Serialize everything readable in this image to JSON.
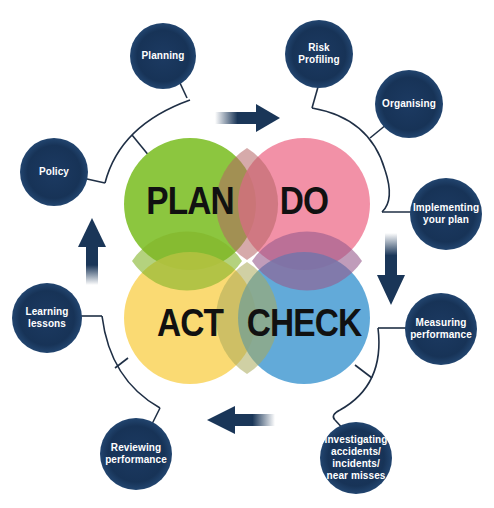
{
  "diagram": {
    "core": [
      {
        "id": "plan",
        "label": "PLAN",
        "color": "#8cc63f"
      },
      {
        "id": "do",
        "label": "DO",
        "color": "#f08aa0"
      },
      {
        "id": "act",
        "label": "ACT",
        "color": "#f9d56a"
      },
      {
        "id": "check",
        "label": "CHECK",
        "color": "#5aa8d6"
      }
    ],
    "nodes": [
      {
        "id": "planning",
        "label": "Planning"
      },
      {
        "id": "risk-profiling",
        "label": "Risk\nProfiling"
      },
      {
        "id": "organising",
        "label": "Organising"
      },
      {
        "id": "implementing",
        "label": "Implementing\nyour plan"
      },
      {
        "id": "measuring",
        "label": "Measuring\nperformance"
      },
      {
        "id": "investigating",
        "label": "Investigating\naccidents/\nincidents/\nnear misses"
      },
      {
        "id": "reviewing",
        "label": "Reviewing\nperformance"
      },
      {
        "id": "learning",
        "label": "Learning\nlessons"
      },
      {
        "id": "policy",
        "label": "Policy"
      }
    ],
    "colors": {
      "node": "#173357",
      "line": "#1f2f45",
      "arrow": "#1a3658"
    }
  }
}
